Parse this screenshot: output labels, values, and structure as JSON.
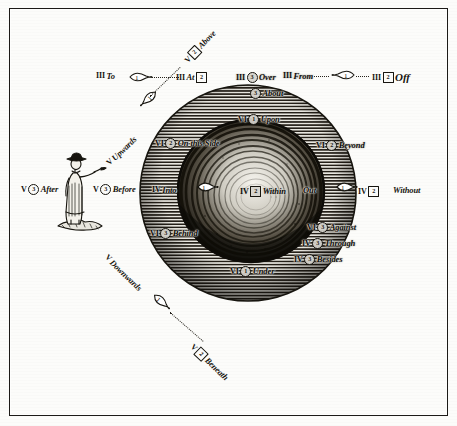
{
  "plate": {
    "title": "Engraved plate of prepositions",
    "caption": "Hatched globe with cavernous interior, labelled prepositions in Roman-numeral classes"
  },
  "labels": {
    "to": {
      "rn": "III",
      "mark": "1",
      "markType": "circle",
      "word": "To"
    },
    "at": {
      "rn": "III",
      "mark": "2",
      "markType": "box",
      "word": "At"
    },
    "over": {
      "rn": "III",
      "mark": "3",
      "markType": "circle",
      "word": "Over"
    },
    "from": {
      "rn": "III",
      "mark": "",
      "markType": "none",
      "word": "From"
    },
    "off": {
      "rn": "III",
      "mark": "2",
      "markType": "box",
      "word": "Off"
    },
    "about": {
      "rn": "",
      "mark": "3",
      "markType": "circle",
      "word": "About"
    },
    "above": {
      "rn": "V",
      "mark": "2",
      "markType": "box",
      "word": "Above"
    },
    "upwards": {
      "rn": "V",
      "mark": "",
      "markType": "none",
      "word": "Upwards"
    },
    "downwards": {
      "rn": "V",
      "mark": "",
      "markType": "none",
      "word": "Downwards"
    },
    "beneath": {
      "rn": "V",
      "mark": "2",
      "markType": "box",
      "word": "Beneath"
    },
    "after": {
      "rn": "V",
      "mark": "3",
      "markType": "circle",
      "word": "After"
    },
    "before": {
      "rn": "V",
      "mark": "3",
      "markType": "circle",
      "word": "Before"
    },
    "upon": {
      "rn": "VI",
      "mark": "1",
      "markType": "circle",
      "word": "Upon"
    },
    "onthisside": {
      "rn": "VI",
      "mark": "2",
      "markType": "circle",
      "word": "On this Side"
    },
    "beyond": {
      "rn": "VI",
      "mark": "2",
      "markType": "circle",
      "word": "Beyond"
    },
    "behind": {
      "rn": "VI",
      "mark": "3",
      "markType": "circle",
      "word": "Behind"
    },
    "against": {
      "rn": "VI",
      "mark": "3",
      "markType": "circle",
      "word": "Against"
    },
    "under": {
      "rn": "VI",
      "mark": "1",
      "markType": "circle",
      "word": "Under"
    },
    "into": {
      "rn": "IV",
      "mark": "",
      "markType": "none",
      "word": "Into"
    },
    "within": {
      "rn": "IV",
      "mark": "2",
      "markType": "box",
      "word": "Within"
    },
    "out": {
      "rn": "",
      "mark": "",
      "markType": "none",
      "word": "Out"
    },
    "without": {
      "rn": "IV",
      "mark": "2",
      "markType": "box",
      "word": "Without"
    },
    "through": {
      "rn": "IV",
      "mark": "3",
      "markType": "circle",
      "word": "Through"
    },
    "besides": {
      "rn": "IV",
      "mark": "3",
      "markType": "circle",
      "word": "Besides"
    }
  },
  "pointers": {
    "to_arrow": "1",
    "off_arrow": "1",
    "upwards_arrow": "1",
    "downwards_arrow": "1",
    "into_arrow": "1",
    "out_arrow": "1"
  },
  "figure": {
    "name": "standing man pointing"
  },
  "colors": {
    "ink": "#17150f",
    "paper": "#fcfcfa",
    "hatch": "#2b2720",
    "frame": "#1c1a17",
    "cave_dark": "#100e0a"
  }
}
